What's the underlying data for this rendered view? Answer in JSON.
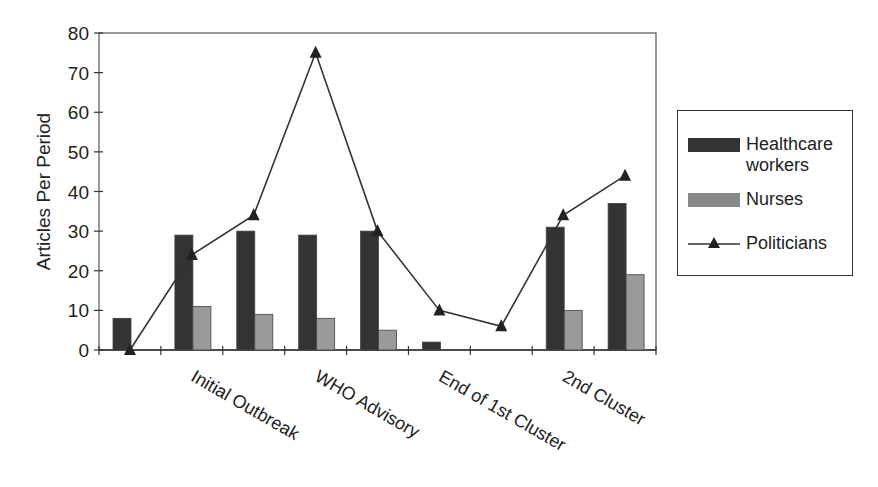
{
  "chart_data": {
    "type": "bar",
    "title": "",
    "xlabel": "",
    "ylabel": "Articles Per Period",
    "ylim": [
      0,
      80
    ],
    "yticks": [
      0,
      10,
      20,
      30,
      40,
      50,
      60,
      70,
      80
    ],
    "grid": false,
    "legend_position": "right",
    "categories": [
      "",
      "Initial Outbreak",
      "",
      "WHO Advisory",
      "",
      "End of 1st Cluster",
      "",
      "2nd Cluster",
      ""
    ],
    "series": [
      {
        "name": "Healthcare workers",
        "type": "bar",
        "color": "#333333",
        "values": [
          8,
          29,
          30,
          29,
          30,
          2,
          0,
          31,
          37
        ]
      },
      {
        "name": "Nurses",
        "type": "bar",
        "color": "#9a9a9a",
        "values": [
          0,
          11,
          9,
          8,
          5,
          0,
          0,
          10,
          19
        ]
      },
      {
        "name": "Politicians",
        "type": "line",
        "marker": "triangle",
        "color": "#333333",
        "values": [
          0,
          24,
          34,
          75,
          30,
          10,
          6,
          34,
          44
        ]
      }
    ]
  },
  "legend": {
    "items": [
      {
        "label_line1": "Healthcare",
        "label_line2": "workers"
      },
      {
        "label_line1": "Nurses"
      },
      {
        "label_line1": "Politicians"
      }
    ]
  }
}
